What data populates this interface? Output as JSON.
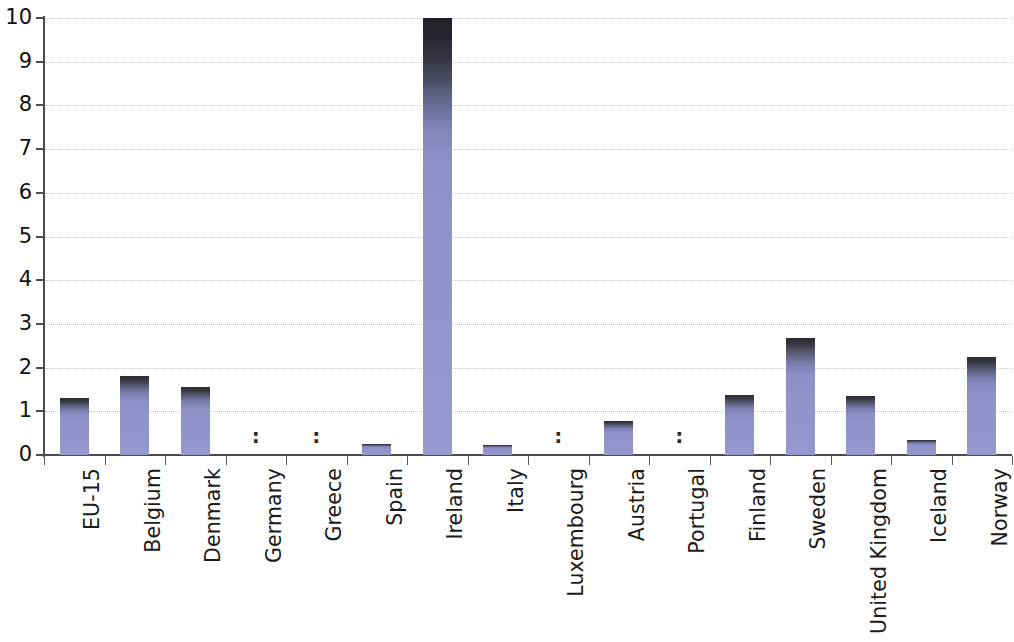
{
  "chart_data": {
    "type": "bar",
    "title": "",
    "subtitle": "",
    "xlabel": "",
    "ylabel": "",
    "ylim": [
      0,
      10
    ],
    "ytick_labels": [
      "0",
      "1",
      "2",
      "3",
      "4",
      "5",
      "6",
      "7",
      "8",
      "9",
      "10"
    ],
    "ytick_values": [
      0,
      1,
      2,
      3,
      4,
      5,
      6,
      7,
      8,
      9,
      10
    ],
    "grid": "horizontal-dotted",
    "legend": "none",
    "missing_marker": ":",
    "bar_color_top": "#2b2b30",
    "bar_color_bottom": "#9094c9",
    "categories": [
      "EU-15",
      "Belgium",
      "Denmark",
      "Germany",
      "Greece",
      "Spain",
      "Ireland",
      "Italy",
      "Luxembourg",
      "Austria",
      "Portugal",
      "Finland",
      "Sweden",
      "United Kingdom",
      "Iceland",
      "Norway"
    ],
    "values": [
      1.3,
      1.8,
      1.55,
      null,
      null,
      0.25,
      10.0,
      0.22,
      null,
      0.78,
      null,
      1.38,
      2.68,
      1.35,
      0.35,
      2.25
    ],
    "missing": [
      "Germany",
      "Greece",
      "Luxembourg",
      "Portugal"
    ]
  }
}
